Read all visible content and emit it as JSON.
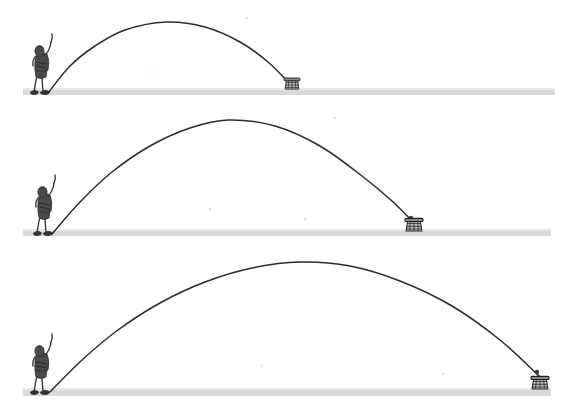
{
  "figure": {
    "title": "Projectile motion: three throws of increasing range",
    "caption": "A person throws a ball along a parabolic arc into a basket; each successive panel shows a longer throw with a higher, wider arc.",
    "background_color": "#ffffff",
    "ink_color": "#2b2b2b",
    "ground_color": "#d9d9d9",
    "panel_count": 3
  },
  "chart_data": {
    "type": "line",
    "title": "Projectile motion: three throws of increasing range",
    "xlabel": "Horizontal distance",
    "ylabel": "Height",
    "grid": false,
    "legend_position": "none",
    "annotations": [
      "Each panel: thrower at left, basket at landing point",
      "Range and peak height both increase from panel 1 to panel 3"
    ],
    "series": [
      {
        "name": "Throw 1 (short range)",
        "panel": 1,
        "launch": {
          "x": 48,
          "y": 93
        },
        "apex": {
          "x": 166,
          "y": 22
        },
        "landing": {
          "x": 292,
          "y": 86
        },
        "range_px": 244,
        "peak_height_px": 71,
        "points": [
          {
            "x": 48,
            "y": 93
          },
          {
            "x": 70,
            "y": 66
          },
          {
            "x": 95,
            "y": 46
          },
          {
            "x": 125,
            "y": 30
          },
          {
            "x": 166,
            "y": 22
          },
          {
            "x": 205,
            "y": 27
          },
          {
            "x": 240,
            "y": 42
          },
          {
            "x": 268,
            "y": 62
          },
          {
            "x": 292,
            "y": 86
          }
        ]
      },
      {
        "name": "Throw 2 (medium range)",
        "panel": 2,
        "launch": {
          "x": 52,
          "y": 234
        },
        "apex": {
          "x": 228,
          "y": 120
        },
        "landing": {
          "x": 414,
          "y": 223
        },
        "range_px": 362,
        "peak_height_px": 114,
        "points": [
          {
            "x": 52,
            "y": 234
          },
          {
            "x": 80,
            "y": 202
          },
          {
            "x": 112,
            "y": 172
          },
          {
            "x": 150,
            "y": 146
          },
          {
            "x": 190,
            "y": 128
          },
          {
            "x": 228,
            "y": 120
          },
          {
            "x": 275,
            "y": 126
          },
          {
            "x": 320,
            "y": 146
          },
          {
            "x": 362,
            "y": 176
          },
          {
            "x": 392,
            "y": 201
          },
          {
            "x": 414,
            "y": 223
          }
        ]
      },
      {
        "name": "Throw 3 (long range)",
        "panel": 3,
        "launch": {
          "x": 50,
          "y": 392
        },
        "apex": {
          "x": 300,
          "y": 262
        },
        "landing": {
          "x": 540,
          "y": 377
        },
        "range_px": 490,
        "peak_height_px": 130,
        "points": [
          {
            "x": 50,
            "y": 392
          },
          {
            "x": 82,
            "y": 360
          },
          {
            "x": 118,
            "y": 330
          },
          {
            "x": 160,
            "y": 303
          },
          {
            "x": 205,
            "y": 282
          },
          {
            "x": 252,
            "y": 268
          },
          {
            "x": 300,
            "y": 262
          },
          {
            "x": 350,
            "y": 266
          },
          {
            "x": 400,
            "y": 281
          },
          {
            "x": 452,
            "y": 306
          },
          {
            "x": 500,
            "y": 340
          },
          {
            "x": 540,
            "y": 377
          }
        ]
      }
    ]
  },
  "panels": [
    {
      "index": 1,
      "label": "Panel 1 - shortest throw",
      "thrower_name": "thrower-figure",
      "target_name": "basket",
      "ground": {
        "x": 23,
        "y": 88,
        "width": 532,
        "height": 8
      },
      "basket": {
        "x": 292,
        "y": 83,
        "size": "small"
      },
      "ball": {
        "x": 289,
        "y": 81
      }
    },
    {
      "index": 2,
      "label": "Panel 2 - medium throw",
      "thrower_name": "thrower-figure",
      "target_name": "basket",
      "ground": {
        "x": 23,
        "y": 229,
        "width": 528,
        "height": 8
      },
      "basket": {
        "x": 414,
        "y": 223,
        "size": "medium"
      },
      "ball": {
        "x": 411,
        "y": 219
      }
    },
    {
      "index": 3,
      "label": "Panel 3 - longest throw",
      "thrower_name": "thrower-figure",
      "target_name": "basket",
      "ground": {
        "x": 23,
        "y": 388,
        "width": 528,
        "height": 9
      },
      "basket": {
        "x": 540,
        "y": 380,
        "size": "medium"
      },
      "ball": {
        "x": 537,
        "y": 372
      }
    }
  ]
}
